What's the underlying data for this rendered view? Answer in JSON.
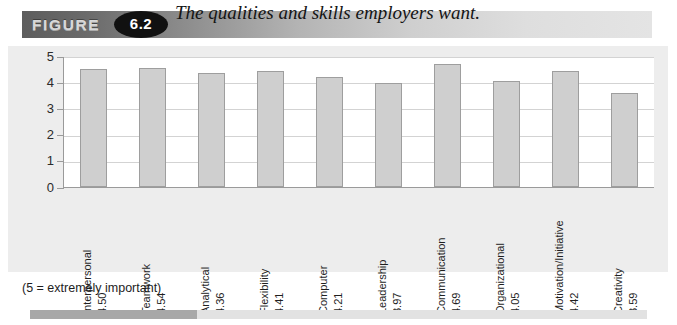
{
  "figure": {
    "label": "FIGURE",
    "number": "6.2",
    "title": "The qualities and skills employers want."
  },
  "footnote": "(5 =  extremely important)",
  "bottom_bar": {
    "fill_percent": 27,
    "fill_color": "#a8a8a8",
    "track_color": "#e2e2e2"
  },
  "colors": {
    "bar_fill": "#cfcfcf",
    "bar_border": "#9e9e9e",
    "panel_bg": "#ededed",
    "plot_bg": "#ffffff",
    "gridline": "#d3d3d3",
    "axis": "#9a9a9a",
    "badge_bg": "#111111",
    "badge_text": "#ffffff"
  },
  "chart_data": {
    "type": "bar",
    "title": "The qualities and skills employers want.",
    "xlabel": "",
    "ylabel": "",
    "ylim": [
      0,
      5
    ],
    "yticks": [
      "0",
      "1",
      "2",
      "3",
      "4",
      "5"
    ],
    "grid": true,
    "legend": false,
    "note": "(5 =  extremely important)",
    "categories": [
      "Interpersonal",
      "Teamwork",
      "Analytical",
      "Flexibility",
      "Computer",
      "Leadership",
      "Communication",
      "Organizational",
      "Motivation/Initiative",
      "Creativity"
    ],
    "values": [
      4.5,
      4.54,
      4.36,
      4.41,
      4.21,
      3.97,
      4.69,
      4.05,
      4.42,
      3.59
    ],
    "value_labels": [
      "4.50",
      "4.54",
      "4.36",
      "4.41",
      "4.21",
      "3.97",
      "4.69",
      "4.05",
      "4.42",
      "3.59"
    ]
  }
}
